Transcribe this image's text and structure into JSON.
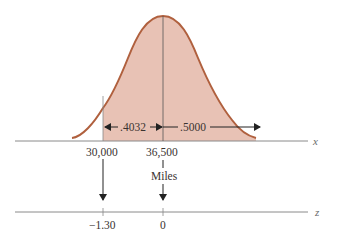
{
  "figure": {
    "type": "normal-distribution-diagram",
    "colors": {
      "curve": "#b0603e",
      "fill": "#e8c2b5",
      "axis": "#8a8a8a",
      "line": "#555555",
      "arrow": "#222222",
      "text": "#3a3330"
    },
    "curve": {
      "mean_label": "36,500",
      "cutoff_label": "30,000",
      "shaded_region": "x >= 30,000"
    },
    "areas": {
      "left_area_label": ".4032",
      "right_area_label": ".5000"
    },
    "x_axis": {
      "name": "x",
      "ticks": [
        "30,000",
        "36,500"
      ],
      "unit_label": "Miles"
    },
    "z_axis": {
      "name": "z",
      "ticks": [
        "−1.30",
        "0"
      ]
    }
  }
}
